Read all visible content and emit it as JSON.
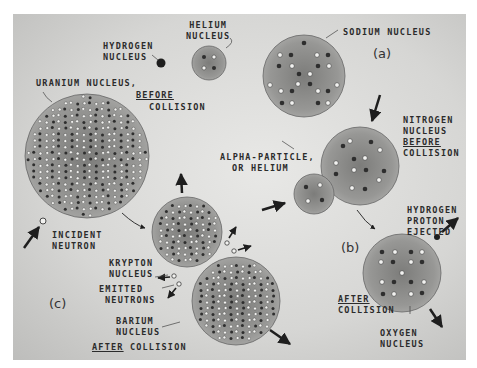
{
  "figure": {
    "panels": [
      {
        "id": "a",
        "tag": "(a)"
      },
      {
        "id": "b",
        "tag": "(b)"
      },
      {
        "id": "c",
        "tag": "(c)"
      }
    ]
  },
  "labels": {
    "hydrogen_nucleus_1": "HYDROGEN",
    "hydrogen_nucleus_2": "NUCLEUS",
    "helium_nucleus_1": "HELIUM",
    "helium_nucleus_2": "NUCLEUS",
    "sodium_nucleus": "SODIUM NUCLEUS",
    "uranium_nucleus": "URANIUM NUCLEUS,",
    "uranium_before": "BEFORE",
    "uranium_collision": "COLLISION",
    "nitrogen_1": "NITROGEN",
    "nitrogen_2": "NUCLEUS",
    "nitrogen_before": "BEFORE",
    "nitrogen_collision": "COLLISION",
    "alpha_1": "ALPHA-PARTICLE,",
    "alpha_2": "OR HELIUM",
    "hydrogen_proton_1": "HYDROGEN",
    "hydrogen_proton_2": "PROTON",
    "hydrogen_proton_3": "EJECTED",
    "incident_1": "INCIDENT",
    "incident_2": "NEUTRON",
    "krypton_1": "KRYPTON",
    "krypton_2": "NUCLEUS",
    "emitted_1": "EMITTED",
    "emitted_2": "NEUTRONS",
    "barium_1": "BARIUM",
    "barium_2": "NUCLEUS",
    "after_c": "AFTER",
    "collision_c": "COLLISION",
    "after_b": "AFTER",
    "collision_b": "COLLISION",
    "oxygen_1": "OXYGEN",
    "oxygen_2": "NUCLEUS"
  },
  "colors": {
    "nucleus_fill": "#8a8a88",
    "proton": "#2e2e2e",
    "neutron": "#f2f2f0",
    "background": "#d8d8d6"
  }
}
